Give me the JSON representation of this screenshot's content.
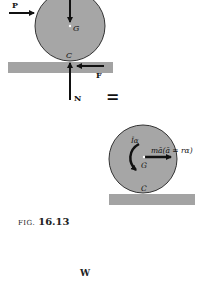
{
  "figure": {
    "caption_prefix": "FIG.",
    "caption_number": "16.13",
    "equals_sign": "=",
    "bottom_label": "W"
  },
  "fbd": {
    "force_P": "P",
    "center_G": "G",
    "contact_C": "C",
    "friction_F": "F",
    "normal_N": "N"
  },
  "kinetic": {
    "moment_label": "Īα",
    "inertia_label": "mā(ā = rα)",
    "center_G": "G",
    "contact_C": "C"
  },
  "colors": {
    "disk_fill": "#a6a6a6",
    "ground_fill": "#a3a3a3",
    "stroke": "#1a1a1a"
  }
}
